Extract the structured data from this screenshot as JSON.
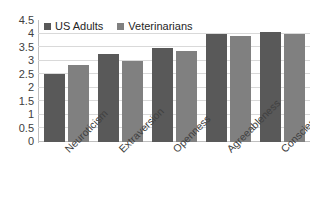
{
  "chart_data": {
    "type": "bar",
    "title": "",
    "subtitle": "",
    "xlabel": "",
    "ylabel": "",
    "categories": [
      "Neuroticism",
      "Extraversion",
      "Openness",
      "Agreeableness",
      "Conscientiousness"
    ],
    "series": [
      {
        "name": "US Adults",
        "color": "#595959",
        "values": [
          2.5,
          3.25,
          3.45,
          4.0,
          4.05
        ]
      },
      {
        "name": "Veterinarians",
        "color": "#808080",
        "values": [
          2.85,
          3.0,
          3.35,
          3.9,
          4.0
        ]
      }
    ],
    "ylim": [
      0,
      4.5
    ],
    "ytick_step": 0.5,
    "ytick_labels": [
      "4.5",
      "4",
      "3.5",
      "3",
      "2.5",
      "2",
      "1.5",
      "1",
      "0.5",
      "0"
    ],
    "ytick_values": [
      4.5,
      4,
      3.5,
      3,
      2.5,
      2,
      1.5,
      1,
      0.5,
      0
    ],
    "grid": true,
    "grid_axis": "y",
    "legend_position": "top-left",
    "xtick_rotation": -45
  },
  "legend": {
    "items": [
      {
        "label": "US Adults",
        "swatch": "legend-swatch-dark"
      },
      {
        "label": "Veterinarians",
        "swatch": "legend-swatch-gray"
      }
    ]
  },
  "colors": {
    "series_us_adults": "#595959",
    "series_veterinarians": "#808080",
    "gridline": "#d9d9d9",
    "axis": "#bfbfbf",
    "text": "#404040",
    "background": "#ffffff"
  }
}
